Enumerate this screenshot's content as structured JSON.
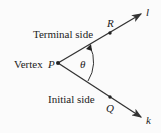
{
  "diagram": {
    "vertex_label": "Vertex",
    "vertex_point": "P",
    "terminal_label": "Terminal side",
    "initial_label": "Initial side",
    "terminal_point": "R",
    "initial_point": "Q",
    "terminal_ray": "l",
    "initial_ray": "k",
    "angle": "θ",
    "colors": {
      "line": "#333333",
      "text": "#222222"
    }
  }
}
